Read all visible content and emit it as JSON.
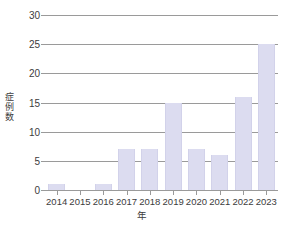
{
  "chart_data": {
    "type": "bar",
    "title": "",
    "xlabel": "年",
    "ylabel": "症例数",
    "categories": [
      "2014",
      "2015",
      "2016",
      "2017",
      "2018",
      "2019",
      "2020",
      "2021",
      "2022",
      "2023"
    ],
    "values": [
      1,
      0,
      1,
      7,
      7,
      15,
      7,
      6,
      16,
      25
    ],
    "ylim": [
      0,
      30
    ],
    "yticks": [
      0,
      5,
      10,
      15,
      20,
      25,
      30
    ],
    "ytick_labels": [
      "0",
      "5",
      "10",
      "15",
      "20",
      "25",
      "30"
    ],
    "grid": true,
    "legend": "none",
    "bar_color": "#dcdcf0",
    "grid_color": "#9a9a9a",
    "text_color": "#3c3c3c",
    "background": "#ffffff"
  },
  "axes": {
    "y_title_chars": [
      "症",
      "例",
      "数"
    ],
    "x_title": "年"
  }
}
